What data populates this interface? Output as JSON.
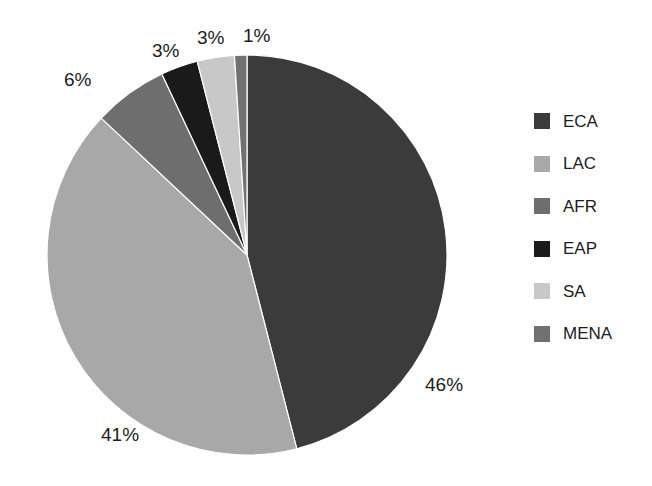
{
  "chart_data": {
    "type": "pie",
    "title": "",
    "xlabel": "",
    "ylabel": "",
    "grid": false,
    "legend_position": "right",
    "start_angle_deg": 0,
    "direction": "clockwise",
    "categories": [
      "ECA",
      "LAC",
      "AFR",
      "EAP",
      "SA",
      "MENA"
    ],
    "values": [
      46,
      41,
      6,
      3,
      3,
      1
    ],
    "value_unit": "%",
    "data_labels": [
      "46%",
      "41%",
      "6%",
      "3%",
      "3%",
      "1%"
    ],
    "colors": [
      "#3b3b3b",
      "#a8a8a8",
      "#6e6e6e",
      "#1a1a1a",
      "#c8c8c8",
      "#717171"
    ],
    "slices": [
      {
        "label": "ECA",
        "value": 46,
        "display": "46%",
        "color": "#3b3b3b"
      },
      {
        "label": "LAC",
        "value": 41,
        "display": "41%",
        "color": "#a8a8a8"
      },
      {
        "label": "AFR",
        "value": 6,
        "display": "6%",
        "color": "#6e6e6e"
      },
      {
        "label": "EAP",
        "value": 3,
        "display": "3%",
        "color": "#1a1a1a"
      },
      {
        "label": "SA",
        "value": 3,
        "display": "3%",
        "color": "#c8c8c8"
      },
      {
        "label": "MENA",
        "value": 1,
        "display": "1%",
        "color": "#717171"
      }
    ]
  },
  "labels": {
    "eca": "46%",
    "lac": "41%",
    "afr": "6%",
    "eap": "3%",
    "sa": "3%",
    "mena": "1%"
  },
  "legend": {
    "items": [
      {
        "label": "ECA",
        "color": "#3b3b3b"
      },
      {
        "label": "LAC",
        "color": "#a8a8a8"
      },
      {
        "label": "AFR",
        "color": "#6e6e6e"
      },
      {
        "label": "EAP",
        "color": "#1a1a1a"
      },
      {
        "label": "SA",
        "color": "#c8c8c8"
      },
      {
        "label": "MENA",
        "color": "#717171"
      }
    ]
  },
  "geometry": {
    "center_x": 247,
    "center_y": 255,
    "radius": 200
  }
}
